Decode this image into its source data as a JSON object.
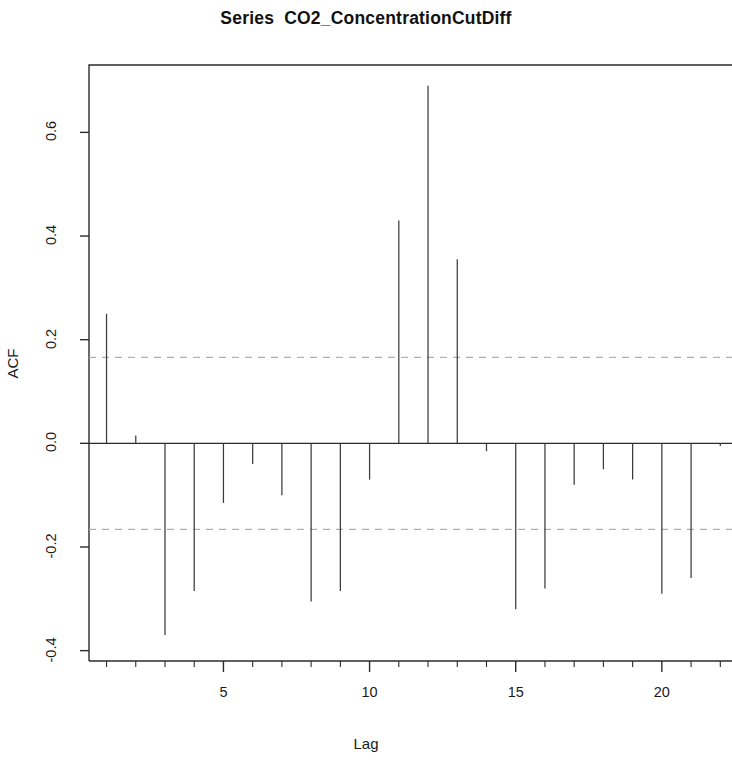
{
  "chart_data": {
    "type": "bar",
    "title": "Series  CO2_ConcentrationCutDiff",
    "xlabel": "Lag",
    "ylabel": "ACF",
    "x": [
      1,
      2,
      3,
      4,
      5,
      6,
      7,
      8,
      9,
      10,
      11,
      12,
      13,
      14,
      15,
      16,
      17,
      18,
      19,
      20,
      21,
      22
    ],
    "values": [
      0.25,
      0.015,
      -0.37,
      -0.285,
      -0.115,
      -0.04,
      -0.1,
      -0.305,
      -0.285,
      -0.07,
      0.43,
      0.69,
      0.355,
      -0.015,
      -0.32,
      -0.28,
      -0.08,
      -0.05,
      -0.07,
      -0.29,
      -0.26,
      -0.005
    ],
    "categories": [
      "1",
      "2",
      "3",
      "4",
      "5",
      "6",
      "7",
      "8",
      "9",
      "10",
      "11",
      "12",
      "13",
      "14",
      "15",
      "16",
      "17",
      "18",
      "19",
      "20",
      "21",
      "22"
    ],
    "xlim": [
      0.4,
      22.4
    ],
    "ylim": [
      -0.42,
      0.73
    ],
    "xticks": [
      5,
      10,
      15,
      20
    ],
    "xtick_labels": [
      "5",
      "10",
      "15",
      "20"
    ],
    "xminor_ticks": [
      1,
      2,
      3,
      4,
      6,
      7,
      8,
      9,
      11,
      12,
      13,
      14,
      16,
      17,
      18,
      19,
      21,
      22
    ],
    "yticks": [
      -0.4,
      -0.2,
      0.0,
      0.2,
      0.4,
      0.6
    ],
    "ytick_labels": [
      "-0.4",
      "-0.2",
      "0.0",
      "0.2",
      "0.4",
      "0.6"
    ],
    "confidence_bounds": [
      0.166,
      -0.166
    ],
    "confidence_line_style": "dashed",
    "confidence_color": "#b0b0b0",
    "zero_line": 0.0,
    "grid": false,
    "legend": null,
    "line_color": "#3c3c3c",
    "axis_color": "#2b2b2b"
  }
}
